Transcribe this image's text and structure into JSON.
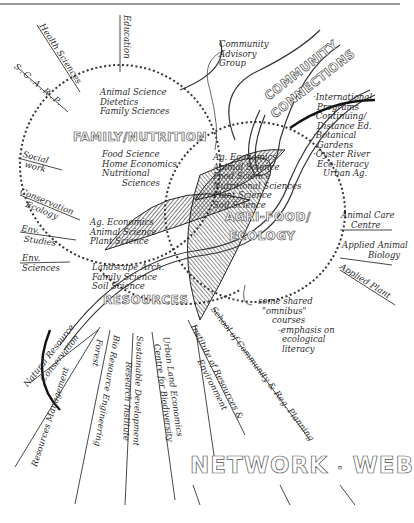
{
  "diagram": {
    "title": "NETWORK · WEB",
    "network_word": "NETWORK",
    "separator": "·",
    "web_word": "WEB"
  },
  "circles": {
    "family_nutrition": {
      "title": "FAMILY/NUTRITION",
      "top_items": [
        "Animal Science",
        "Dietetics",
        "Family Sciences"
      ],
      "bottom_items": [
        "Food Science",
        "Home Economics",
        "Nutritional",
        "Sciences"
      ]
    },
    "agri_food_ecology": {
      "title_line1": "AGRI-FOOD/",
      "title_line2": "ECOLOGY",
      "items": [
        "Ag. Economics",
        "Animal Science",
        "Food Science",
        "Nutritional Sciences",
        "Plant Science",
        "Soil Science"
      ]
    },
    "resources": {
      "title": "RESOURCES",
      "overlap_items": [
        "Ag. Economics",
        "Animal Science",
        "Plant Science"
      ],
      "items": [
        "Landscape Arch.",
        "Family Science",
        "Soil Science"
      ]
    }
  },
  "community_connections": {
    "title_line1": "COMMUNITY",
    "title_line2": "CONNECTIONS",
    "advisory": [
      "Community",
      "Advisory",
      "Group"
    ],
    "items": [
      [
        "·International",
        "Programs"
      ],
      [
        "·Continuing/",
        "Distance Ed."
      ],
      [
        "·Botanical",
        "Gardens"
      ],
      [
        "·Oyster River",
        "Eco-literacy",
        "Urban Ag."
      ]
    ]
  },
  "spokes": {
    "top": [
      "Health Sciences",
      "S.C.A.R.P.",
      "Education",
      "Social",
      "work"
    ],
    "left": [
      [
        "Conservation",
        "Ecology"
      ],
      [
        "Env.",
        "Studies"
      ],
      [
        "Env.",
        "Sciences"
      ]
    ],
    "right": [
      [
        "Animal Care",
        "Centre"
      ],
      [
        "Applied Animal",
        "Biology"
      ],
      [
        "Applied Plant",
        "Biology"
      ]
    ],
    "bottom": [
      [
        "Natural Resource",
        "Conservation"
      ],
      [
        "Forest",
        "Resources Management"
      ],
      [
        "Bio Resource Engineering"
      ],
      [
        "Sustainable Development",
        "Research Institute"
      ],
      [
        "Urban Land Economics",
        "Centre for Biodiversity"
      ],
      [
        "Institute of Resources &",
        "Environment"
      ],
      [
        "School of Community & Reg. Planning"
      ]
    ]
  },
  "annotation": {
    "lines": [
      "some shared",
      "\"omnibus\"",
      "courses",
      "-emphasis on",
      "ecological",
      "literacy"
    ]
  }
}
